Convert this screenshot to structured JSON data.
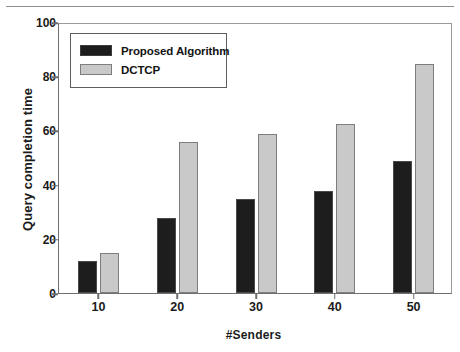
{
  "figure": {
    "top_rule": true,
    "background": "#ffffff"
  },
  "chart_data": {
    "type": "bar",
    "title": "",
    "xlabel": "#Senders",
    "ylabel": "Query completion time",
    "categories": [
      "10",
      "20",
      "30",
      "40",
      "50"
    ],
    "series": [
      {
        "name": "Proposed Algorithm",
        "color": "#1d1d1d",
        "values": [
          12,
          28,
          35,
          38,
          49
        ]
      },
      {
        "name": "DCTCP",
        "color": "#c9c9c9",
        "values": [
          15,
          56,
          59,
          63,
          85
        ]
      }
    ],
    "ylim": [
      0,
      100
    ],
    "yticks": [
      0,
      20,
      40,
      60,
      80,
      100
    ],
    "ytick_labels": [
      "0",
      "20",
      "40",
      "60",
      "80",
      "100"
    ],
    "xlim": [
      0,
      5
    ],
    "grid": false,
    "legend_position": "upper left",
    "frame": true
  }
}
